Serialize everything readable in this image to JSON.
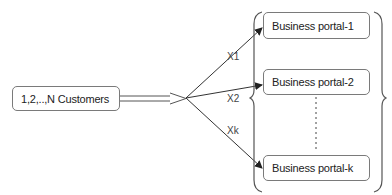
{
  "diagram": {
    "source": {
      "label": "1,2,..,N Customers"
    },
    "edges": [
      {
        "label": "X1",
        "target": 0
      },
      {
        "label": "X2",
        "target": 1
      },
      {
        "label": "Xk",
        "target": 2
      }
    ],
    "portals": [
      {
        "label": "Business portal-1"
      },
      {
        "label": "Business portal-2"
      },
      {
        "label": "Business portal-k"
      }
    ],
    "colors": {
      "line": "#333333",
      "box_border": "#7a7a7a",
      "text": "#222222"
    }
  }
}
